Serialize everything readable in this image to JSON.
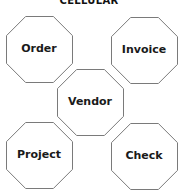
{
  "title": "CELLULAR",
  "cells": [
    {
      "id": "order",
      "label": "Order",
      "x": 6,
      "y": 16,
      "size": 66
    },
    {
      "id": "invoice",
      "label": "Invoice",
      "x": 111,
      "y": 17,
      "size": 66
    },
    {
      "id": "vendor",
      "label": "Vendor",
      "x": 57,
      "y": 69,
      "size": 66
    },
    {
      "id": "project",
      "label": "Project",
      "x": 6,
      "y": 122,
      "size": 66
    },
    {
      "id": "check",
      "label": "Check",
      "x": 111,
      "y": 123,
      "size": 66
    }
  ],
  "colors": {
    "stroke": "#7a7a7a",
    "fill": "#ffffff",
    "text": "#1a1a1a"
  }
}
